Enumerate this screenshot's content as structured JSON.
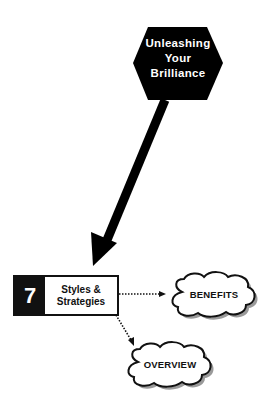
{
  "hexagon": {
    "line1": "Unleashing",
    "line2": "Your",
    "line3": "Brilliance",
    "fill": "#000000",
    "text_color": "#ffffff"
  },
  "step_box": {
    "number": "7",
    "label_line1": "Styles &",
    "label_line2": "Strategies"
  },
  "clouds": [
    {
      "label": "BENEFITS"
    },
    {
      "label": "OVERVIEW"
    }
  ],
  "colors": {
    "ink": "#111111",
    "shadow": "#9a9a9a",
    "background": "#ffffff"
  }
}
